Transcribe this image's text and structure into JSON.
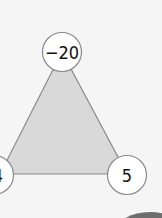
{
  "diagram": {
    "shape": "triangle",
    "fill_color": "#d9d9d9",
    "edge_color": "#8a8a8a",
    "nodes": [
      {
        "position": "top",
        "value": "−20"
      },
      {
        "position": "bottom-left",
        "value": "4"
      },
      {
        "position": "bottom-right",
        "value": "5"
      }
    ]
  }
}
